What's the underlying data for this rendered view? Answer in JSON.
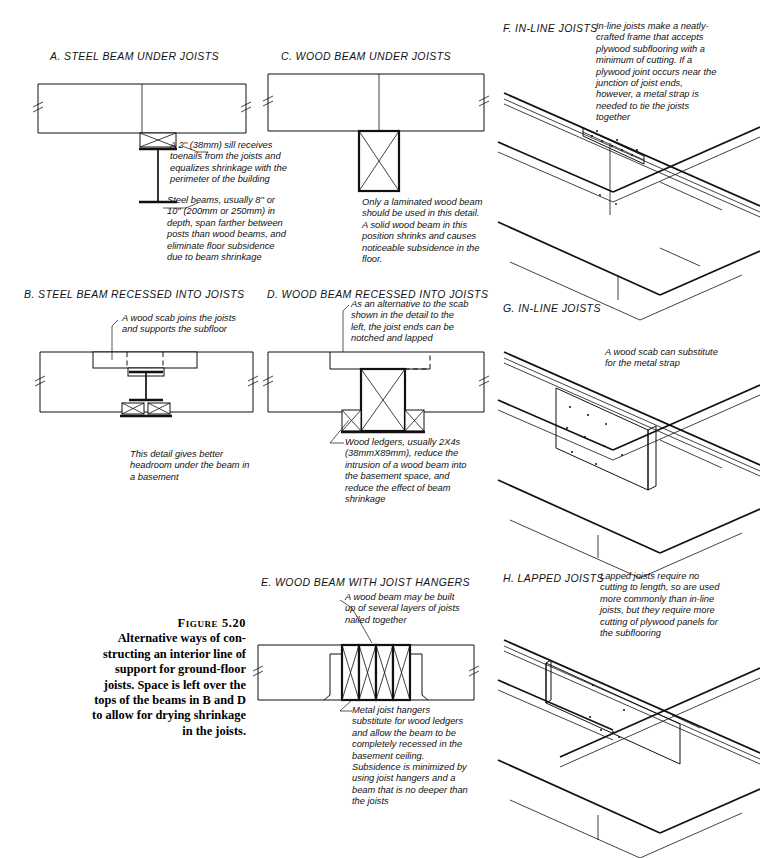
{
  "figure": {
    "number_label": "Figure 5.20",
    "caption_lines": [
      "Alternative ways of con-",
      "structing an interior line of",
      "support for ground-floor",
      "joists. Space is left over the",
      "tops of the beams in B and D",
      "to allow for drying shrinkage",
      "in the joists."
    ],
    "caption_text": "Figure 5.20 Alternative ways of constructing an interior line of support for ground-floor joists. Space is left over the tops of the beams in B and D to allow for drying shrinkage in the joists."
  },
  "panels": [
    {
      "key": "A",
      "title": "A.  STEEL BEAM UNDER JOISTS",
      "type": "section",
      "notes": [
        "A 2'' (38mm) sill receives toenails from the joists and equalizes shrinkage with the perimeter of the building",
        "Steel beams, usually 8'' or 10'' (200mm or 250mm) in depth, span farther between posts than wood beams, and eliminate floor subsidence due to beam shrinkage"
      ]
    },
    {
      "key": "B",
      "title": "B.  STEEL BEAM RECESSED INTO JOISTS",
      "type": "section",
      "notes": [
        "A wood scab joins the joists and supports the subfloor",
        "This detail gives better headroom under the beam in a basement"
      ]
    },
    {
      "key": "C",
      "title": "C.  WOOD BEAM UNDER JOISTS",
      "type": "section",
      "notes": [
        "Only a laminated wood beam should be used in this detail. A solid wood beam in this position shrinks and causes noticeable subsidence in the floor."
      ]
    },
    {
      "key": "D",
      "title": "D.  WOOD BEAM RECESSED INTO JOISTS",
      "type": "section",
      "notes": [
        "As an alternative to the scab shown in the detail to the left, the joist ends can be notched and lapped",
        "Wood ledgers, usually 2X4s (38mmX89mm), reduce the intrusion of a wood beam into the basement space, and reduce the effect of beam shrinkage"
      ]
    },
    {
      "key": "E",
      "title": "E.  WOOD BEAM WITH JOIST HANGERS",
      "type": "section",
      "notes": [
        "A wood beam may be built up of several layers of joists nailed together",
        "Metal joist hangers substitute for wood ledgers and allow the beam to be completely recessed in the basement ceiling. Subsidence is minimized by using joist hangers and a beam that is no deeper than the joists"
      ]
    },
    {
      "key": "F",
      "title": "F.  IN-LINE JOISTS",
      "type": "isometric",
      "notes": [
        "In-line joists make a neatly-crafted frame that accepts plywood subflooring with a minimum of cutting. If a plywood joint occurs near the junction of joist ends, however, a metal strap is needed to tie the joists together"
      ]
    },
    {
      "key": "G",
      "title": "G.  IN-LINE JOISTS",
      "type": "isometric",
      "notes": [
        "A wood scab can substitute for the metal strap"
      ]
    },
    {
      "key": "H",
      "title": "H.  LAPPED JOISTS",
      "type": "isometric",
      "notes": [
        "Lapped joists require no cutting to length, so are used more commonly than in-line joists, but they require more cutting of plywood panels for the subflooring"
      ]
    }
  ],
  "colors": {
    "ink": "#111111",
    "paper": "#ffffff"
  }
}
